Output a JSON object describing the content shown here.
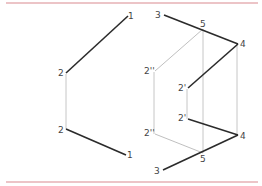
{
  "colors": {
    "rule": "#d98a8f",
    "heavy": "#2b2b2b",
    "thin": "#b8b8b8",
    "label": "#444444"
  },
  "left_view": {
    "labels": {
      "p1_top": "1",
      "p2_upper": "2",
      "p2_lower": "2",
      "p1_bottom": "1"
    }
  },
  "right_view": {
    "labels": {
      "p3_top": "3",
      "p5_top": "5",
      "p4_top": "4",
      "p2prime_upper": "2'",
      "p2dprime_upper": "2''",
      "p2prime_lower": "2'",
      "p2dprime_lower": "2''",
      "p4_bottom": "4",
      "p5_bottom": "5",
      "p3_bottom": "3"
    }
  }
}
